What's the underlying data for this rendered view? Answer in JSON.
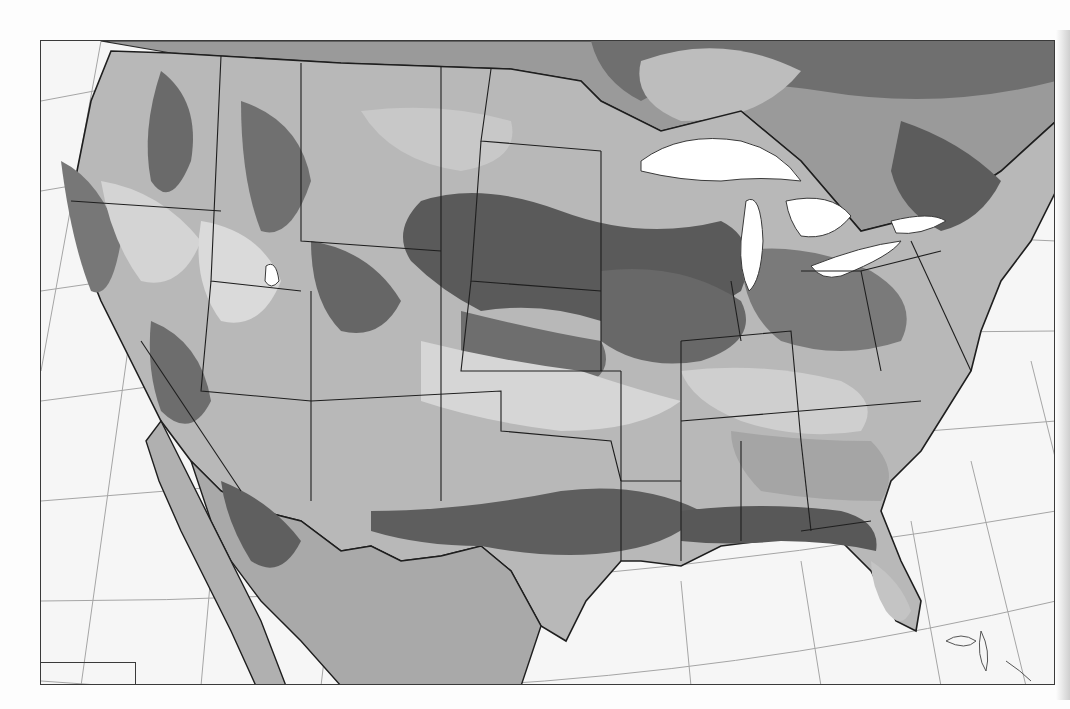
{
  "map": {
    "subject": "contiguous-united-states",
    "style": "grayscale-thematic-zones",
    "colors": {
      "page_background": "#fdfdfd",
      "ocean": "#f6f6f6",
      "frame": "#3a3a3a",
      "graticule": "#9a9a9a",
      "state_border": "#1e1e1e",
      "zone_lightest": "#d9d9d9",
      "zone_light": "#bdbdbd",
      "zone_medium": "#9c9c9c",
      "zone_dark": "#7a7a7a",
      "zone_darkest": "#555555",
      "lakes": "#ffffff"
    },
    "features": [
      "graticule-grid",
      "state-boundaries",
      "zone-contours",
      "great-lakes",
      "inset-box-lower-left",
      "bahamas-outline",
      "baja-california",
      "southern-canada"
    ]
  }
}
